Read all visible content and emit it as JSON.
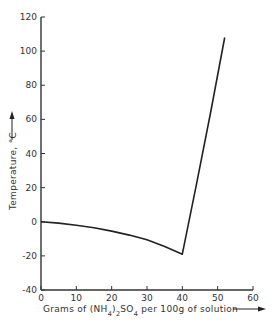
{
  "chart_data": {
    "type": "line",
    "title": "",
    "xlabel": "Grams of (NH4)2SO4 per 100g of solution",
    "xlabel_parts": {
      "pre": "Grams of (NH",
      "sub1": "4",
      "mid": ")",
      "sub2": "2",
      "mid2": "SO",
      "sub3": "4",
      "post": " per 100g of solution"
    },
    "ylabel": "Temperature, °C",
    "xlim": [
      0,
      60
    ],
    "ylim": [
      -40,
      120
    ],
    "xticks": [
      0,
      10,
      20,
      30,
      40,
      50,
      60
    ],
    "yticks": [
      -40,
      -20,
      0,
      20,
      40,
      60,
      80,
      100,
      120
    ],
    "grid": false,
    "legend": null,
    "series": [
      {
        "name": "Freezing point / solubility curve",
        "x": [
          0,
          5,
          10,
          15,
          20,
          25,
          30,
          35,
          40,
          44,
          48,
          52
        ],
        "y": [
          0,
          -0.8,
          -2,
          -3.5,
          -5.5,
          -7.8,
          -10.5,
          -14.5,
          -19,
          22,
          64,
          108
        ]
      }
    ],
    "annotations": [
      "eutectic point at about 40 g, -19 °C"
    ]
  }
}
